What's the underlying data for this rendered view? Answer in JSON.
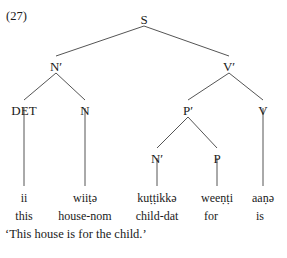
{
  "figure": {
    "example_number": "(27)",
    "translation": "‘This house is for the child.’",
    "line_color": "#555555",
    "text_color": "#1a1a1a",
    "background": "#ffffff"
  },
  "tree": {
    "nodes": {
      "s": "S",
      "np_bar": "N′",
      "vp_bar": "V′",
      "det": "DET",
      "n": "N",
      "pp_bar": "P′",
      "v": "V",
      "np_bar2": "N′",
      "p": "P"
    }
  },
  "terminals": [
    {
      "word": "ii",
      "gloss": "this"
    },
    {
      "word": "wiiṭə",
      "gloss": "house-nom"
    },
    {
      "word": "kuṭṭikkə",
      "gloss": "child-dat"
    },
    {
      "word": "weeṇṭi",
      "gloss": "for"
    },
    {
      "word": "aaṇə",
      "gloss": "is"
    }
  ]
}
